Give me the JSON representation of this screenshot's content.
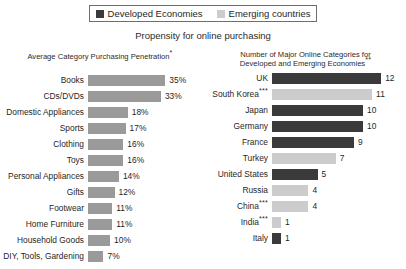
{
  "legend": {
    "entries": [
      {
        "label": "Developed Economies",
        "color": "#3a3a3a",
        "swatch": "dark"
      },
      {
        "label": "Emerging countries",
        "color": "#cccccc",
        "swatch": "light"
      }
    ]
  },
  "title": "Propensity for online purchasing",
  "chart_data": [
    {
      "type": "bar",
      "orientation": "horizontal",
      "id": "purchasing-penetration",
      "title": "Average Category Purchasing Penetration",
      "title_note": "*",
      "xlabel": "",
      "ylabel": "",
      "xlim": [
        0,
        35
      ],
      "grid": false,
      "legend_position": "top-center-shared",
      "value_suffix": "%",
      "bar_color": "#9a9a9a",
      "categories": [
        "Books",
        "CDs/DVDs",
        "Domestic Appliances",
        "Sports",
        "Clothing",
        "Toys",
        "Personal Appliances",
        "Gifts",
        "Footwear",
        "Home Furniture",
        "Household Goods",
        "DIY, Tools, Gardening"
      ],
      "values": [
        35,
        33,
        18,
        17,
        16,
        16,
        14,
        12,
        11,
        11,
        10,
        7
      ],
      "value_labels": [
        "35%",
        "33%",
        "18%",
        "17%",
        "16%",
        "16%",
        "14%",
        "12%",
        "11%",
        "11%",
        "10%",
        "7%"
      ]
    },
    {
      "type": "bar",
      "orientation": "horizontal",
      "id": "major-online-categories",
      "title_line1": "Number of Major Online Categories for",
      "title_line2": "Developed and Emerging Economies",
      "title_note": "**",
      "xlabel": "",
      "ylabel": "",
      "xlim": [
        0,
        12
      ],
      "grid": false,
      "legend_position": "top-center-shared",
      "value_suffix": "",
      "categories": [
        "UK",
        "South Korea",
        "Japan",
        "Germany",
        "France",
        "Turkey",
        "United States",
        "Russia",
        "China",
        "India",
        "Italy"
      ],
      "category_notes": [
        "",
        "***",
        "",
        "",
        "",
        "",
        "",
        "",
        "***",
        "***",
        ""
      ],
      "values": [
        12,
        11,
        10,
        10,
        9,
        7,
        5,
        4,
        4,
        1,
        1
      ],
      "value_labels": [
        "12",
        "11",
        "10",
        "10",
        "9",
        "7",
        "5",
        "4",
        "4",
        "1",
        "1"
      ],
      "group": [
        "developed",
        "emerging",
        "developed",
        "developed",
        "developed",
        "emerging",
        "developed",
        "emerging",
        "emerging",
        "emerging",
        "developed"
      ],
      "colors": [
        "#3a3a3a",
        "#cccccc",
        "#3a3a3a",
        "#3a3a3a",
        "#3a3a3a",
        "#cccccc",
        "#3a3a3a",
        "#cccccc",
        "#cccccc",
        "#cccccc",
        "#3a3a3a"
      ]
    }
  ]
}
